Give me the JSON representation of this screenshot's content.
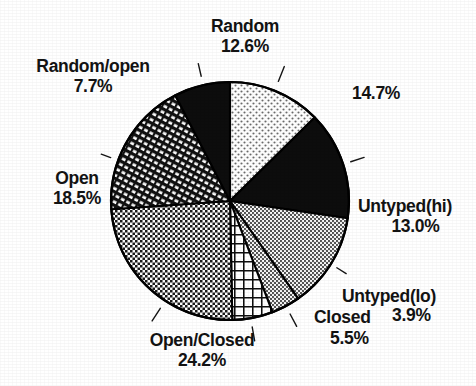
{
  "chart_data": {
    "type": "pie",
    "title": "",
    "subtitle": "",
    "xlabel": "",
    "ylabel": "",
    "legend_position": "none",
    "grid": false,
    "units": "percent",
    "total_percent": "100.1%",
    "categories": [
      "Random",
      "",
      "Untyped(hi)",
      "Untyped(lo)",
      "Closed",
      "Open/Closed",
      "Open",
      "Random/open"
    ],
    "values": [
      12.6,
      14.7,
      13.0,
      3.9,
      5.5,
      24.2,
      18.5,
      7.7
    ],
    "slices": [
      {
        "label": "Random",
        "percent_text": "12.6%",
        "value": 12.6,
        "fill": "light-stipple",
        "color": "#f2f2f2",
        "start_deg": 0.0,
        "end_deg": 45.4
      },
      {
        "label": "",
        "percent_text": "14.7%",
        "value": 14.7,
        "fill": "solid-black",
        "color": "#0d0d0d",
        "start_deg": 45.4,
        "end_deg": 98.3
      },
      {
        "label": "Untyped(hi)",
        "percent_text": "13.0%",
        "value": 13.0,
        "fill": "gray-stipple",
        "color": "#a8a8a8",
        "start_deg": 98.3,
        "end_deg": 145.1
      },
      {
        "label": "Untyped(lo)",
        "percent_text": "3.9%",
        "value": 3.9,
        "fill": "gray-stipple",
        "color": "#a8a8a8",
        "start_deg": 145.1,
        "end_deg": 159.1
      },
      {
        "label": "Closed",
        "percent_text": "5.5%",
        "value": 5.5,
        "fill": "coarse-grid",
        "color": "#4a4a4a",
        "start_deg": 159.1,
        "end_deg": 178.9
      },
      {
        "label": "Open/Closed",
        "percent_text": "24.2%",
        "value": 24.2,
        "fill": "fine-checker",
        "color": "#8c8c8c",
        "start_deg": 178.9,
        "end_deg": 266.0
      },
      {
        "label": "Open",
        "percent_text": "18.5%",
        "value": 18.5,
        "fill": "diagonal-hatch",
        "color": "#5e5e5e",
        "start_deg": 266.0,
        "end_deg": 332.6
      },
      {
        "label": "Random/open",
        "percent_text": "7.7%",
        "value": 7.7,
        "fill": "solid-black",
        "color": "#0d0d0d",
        "start_deg": 332.6,
        "end_deg": 360.0
      }
    ]
  },
  "labels": {
    "random": {
      "name": "Random",
      "percent": "12.6%"
    },
    "random_open": {
      "name": "Random/open",
      "percent": "7.7%"
    },
    "open": {
      "name": "Open",
      "percent": "18.5%"
    },
    "unnamed": {
      "name": "",
      "percent": "14.7%"
    },
    "untyped_hi": {
      "name": "Untyped(hi)",
      "percent": "13.0%"
    },
    "untyped_lo": {
      "name": "Untyped(lo)",
      "percent": "3.9%"
    },
    "closed": {
      "name": "Closed",
      "percent": "5.5%"
    },
    "open_closed": {
      "name": "Open/Closed",
      "percent": "24.2%"
    }
  },
  "colors": {
    "background": "#ffffff",
    "ink": "#131313",
    "outline": "#000000",
    "solid_black": "#0d0d0d",
    "light_stipple": "#f2f2f2",
    "gray_stipple": "#a8a8a8"
  },
  "geometry": {
    "center_x": 230,
    "center_y": 201,
    "radius": 119
  }
}
